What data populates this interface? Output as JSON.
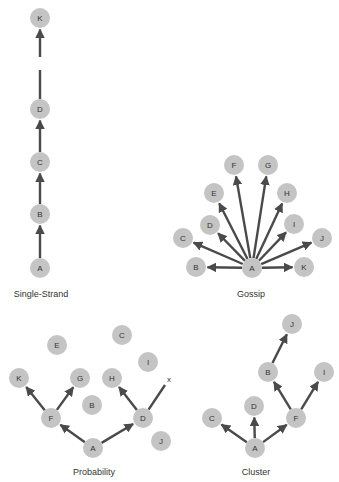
{
  "diagrams": [
    {
      "id": "single-strand",
      "caption": "Single-Strand",
      "caption_pos": [
        41,
        297
      ],
      "nodes": [
        {
          "label": "K",
          "x": 40,
          "y": 18
        },
        {
          "label": "D",
          "x": 40,
          "y": 109
        },
        {
          "label": "C",
          "x": 40,
          "y": 162
        },
        {
          "label": "B",
          "x": 40,
          "y": 214
        },
        {
          "label": "A",
          "x": 40,
          "y": 268
        }
      ],
      "edges": [
        {
          "from": "A",
          "to": "B",
          "arrow": true
        },
        {
          "from": "B",
          "to": "C",
          "arrow": true
        },
        {
          "from": "C",
          "to": "D",
          "arrow": true
        },
        {
          "from": "D",
          "to": [
            40,
            70
          ],
          "arrow": false
        },
        {
          "from": [
            40,
            57
          ],
          "to": "K",
          "arrow": true
        }
      ]
    },
    {
      "id": "gossip",
      "caption": "Gossip",
      "caption_pos": [
        251,
        297
      ],
      "nodes": [
        {
          "label": "A",
          "x": 252,
          "y": 268
        },
        {
          "label": "B",
          "x": 196,
          "y": 267
        },
        {
          "label": "C",
          "x": 183,
          "y": 238
        },
        {
          "label": "D",
          "x": 210,
          "y": 225
        },
        {
          "label": "E",
          "x": 214,
          "y": 193
        },
        {
          "label": "F",
          "x": 234,
          "y": 165
        },
        {
          "label": "G",
          "x": 268,
          "y": 165
        },
        {
          "label": "H",
          "x": 287,
          "y": 193
        },
        {
          "label": "I",
          "x": 294,
          "y": 224
        },
        {
          "label": "J",
          "x": 322,
          "y": 238
        },
        {
          "label": "K",
          "x": 304,
          "y": 267
        }
      ],
      "edges": [
        {
          "from": "A",
          "to": "B",
          "arrow": true
        },
        {
          "from": "A",
          "to": "C",
          "arrow": true
        },
        {
          "from": "A",
          "to": "D",
          "arrow": true
        },
        {
          "from": "A",
          "to": "E",
          "arrow": true
        },
        {
          "from": "A",
          "to": "F",
          "arrow": true
        },
        {
          "from": "A",
          "to": "G",
          "arrow": true
        },
        {
          "from": "A",
          "to": "H",
          "arrow": true
        },
        {
          "from": "A",
          "to": "I",
          "arrow": true
        },
        {
          "from": "A",
          "to": "J",
          "arrow": true
        },
        {
          "from": "A",
          "to": "K",
          "arrow": true
        }
      ]
    },
    {
      "id": "probability",
      "caption": "Probability",
      "caption_pos": [
        94,
        475
      ],
      "nodes": [
        {
          "label": "E",
          "x": 57,
          "y": 345
        },
        {
          "label": "C",
          "x": 122,
          "y": 335
        },
        {
          "label": "I",
          "x": 148,
          "y": 362
        },
        {
          "label": "K",
          "x": 19,
          "y": 378
        },
        {
          "label": "G",
          "x": 80,
          "y": 378
        },
        {
          "label": "H",
          "x": 112,
          "y": 378
        },
        {
          "label": "B",
          "x": 92,
          "y": 405
        },
        {
          "label": "F",
          "x": 51,
          "y": 418
        },
        {
          "label": "D",
          "x": 143,
          "y": 418
        },
        {
          "label": "A",
          "x": 93,
          "y": 448
        },
        {
          "label": "J",
          "x": 161,
          "y": 441
        }
      ],
      "edges": [
        {
          "from": "A",
          "to": "F",
          "arrow": true
        },
        {
          "from": "A",
          "to": "D",
          "arrow": true
        },
        {
          "from": "F",
          "to": "K",
          "arrow": true
        },
        {
          "from": "F",
          "to": "G",
          "arrow": true
        },
        {
          "from": "D",
          "to": "H",
          "arrow": true
        },
        {
          "from": "D",
          "to": [
            165,
            385
          ],
          "arrow": false
        }
      ],
      "marks": [
        {
          "text": "x",
          "x": 169,
          "y": 382
        }
      ]
    },
    {
      "id": "cluster",
      "caption": "Cluster",
      "caption_pos": [
        256,
        475
      ],
      "nodes": [
        {
          "label": "J",
          "x": 292,
          "y": 324
        },
        {
          "label": "B",
          "x": 268,
          "y": 372
        },
        {
          "label": "I",
          "x": 324,
          "y": 372
        },
        {
          "label": "D",
          "x": 254,
          "y": 406
        },
        {
          "label": "C",
          "x": 212,
          "y": 418
        },
        {
          "label": "F",
          "x": 296,
          "y": 418
        },
        {
          "label": "A",
          "x": 255,
          "y": 448
        }
      ],
      "edges": [
        {
          "from": "A",
          "to": "C",
          "arrow": true
        },
        {
          "from": "A",
          "to": "D",
          "arrow": true
        },
        {
          "from": "A",
          "to": "F",
          "arrow": true
        },
        {
          "from": "F",
          "to": "B",
          "arrow": true
        },
        {
          "from": "F",
          "to": "I",
          "arrow": true
        },
        {
          "from": "B",
          "to": "J",
          "arrow": true
        }
      ]
    }
  ],
  "style": {
    "node_fill": "#c4c4c4",
    "edge_color": "#4a4a4a",
    "text_color": "#333333",
    "node_radius": 10
  }
}
